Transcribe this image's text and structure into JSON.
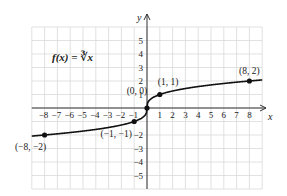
{
  "chart_data": {
    "type": "line",
    "title": "f(x) = ∛x",
    "function": "cube root",
    "xlabel": "x",
    "ylabel": "y",
    "xlim": [
      -9,
      9
    ],
    "ylim": [
      -6,
      6
    ],
    "grid": true,
    "x_ticks": [
      -8,
      -7,
      -6,
      -5,
      -4,
      -3,
      -2,
      -1,
      1,
      2,
      3,
      4,
      5,
      6,
      7,
      8
    ],
    "y_ticks": [
      -5,
      -4,
      -3,
      -2,
      1,
      2,
      3,
      4,
      5
    ],
    "x_tick_labels": [
      "−8",
      "−7",
      "−6",
      "−5",
      "−4",
      "−3",
      "−2",
      "−1",
      "1",
      "2",
      "3",
      "4",
      "5",
      "6",
      "7",
      "8"
    ],
    "y_tick_labels": [
      "−5",
      "−4",
      "−3",
      "−2",
      "1",
      "2",
      "3",
      "4",
      "5"
    ],
    "series": [
      {
        "name": "f(x) = ∛x",
        "x": [
          -9,
          -8,
          -6,
          -4,
          -2,
          -1,
          -0.5,
          -0.125,
          0,
          0.125,
          0.5,
          1,
          2,
          4,
          6,
          8,
          9
        ],
        "y": [
          -2.08,
          -2,
          -1.817,
          -1.587,
          -1.26,
          -1,
          -0.794,
          -0.5,
          0,
          0.5,
          0.794,
          1,
          1.26,
          1.587,
          1.817,
          2,
          2.08
        ]
      }
    ],
    "highlighted_points": [
      {
        "x": -8,
        "y": -2,
        "label": "(−8, −2)"
      },
      {
        "x": -1,
        "y": -1,
        "label": "(−1, −1)"
      },
      {
        "x": 0,
        "y": 0,
        "label": "(0, 0)"
      },
      {
        "x": 1,
        "y": 1,
        "label": "(1, 1)"
      },
      {
        "x": 8,
        "y": 2,
        "label": "(8, 2)"
      }
    ],
    "colors": {
      "curve": "#111111",
      "grid": "#d9d9d9",
      "axis": "#333333"
    }
  }
}
